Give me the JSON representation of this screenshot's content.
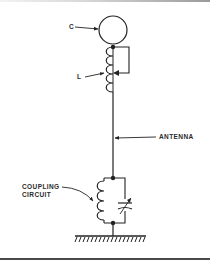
{
  "diagram": {
    "type": "antenna-circuit-schematic",
    "labels": {
      "capacitor_top": "C",
      "inductor": "L",
      "antenna": "ANTENNA",
      "coupling_line1": "COUPLING",
      "coupling_line2": "CIRCUIT"
    },
    "components": [
      {
        "id": "C",
        "kind": "capacitance-hat (circle)"
      },
      {
        "id": "L",
        "kind": "loading coil with sliding tap"
      },
      {
        "id": "antenna",
        "kind": "vertical wire"
      },
      {
        "id": "coupling-circuit",
        "kind": "parallel LC (coil + variable capacitor)"
      },
      {
        "id": "ground",
        "kind": "earth ground"
      }
    ],
    "colors": {
      "ink": "#222222",
      "background": "#ffffff"
    }
  }
}
